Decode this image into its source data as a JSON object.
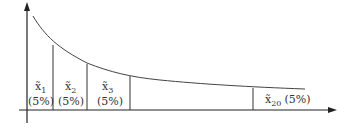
{
  "diagram": {
    "type": "decreasing-curve-partition",
    "axes": {
      "x_arrow": true,
      "y_arrow": true
    },
    "segments": [
      {
        "var": "x̃",
        "sub": "1",
        "pct": "(5%)"
      },
      {
        "var": "x̃",
        "sub": "2",
        "pct": "(5%)"
      },
      {
        "var": "x̃",
        "sub": "3",
        "pct": "(5%)"
      },
      {
        "var": "x̃",
        "sub": "20",
        "pct": "(5%)"
      }
    ],
    "line_color": "#333333"
  }
}
